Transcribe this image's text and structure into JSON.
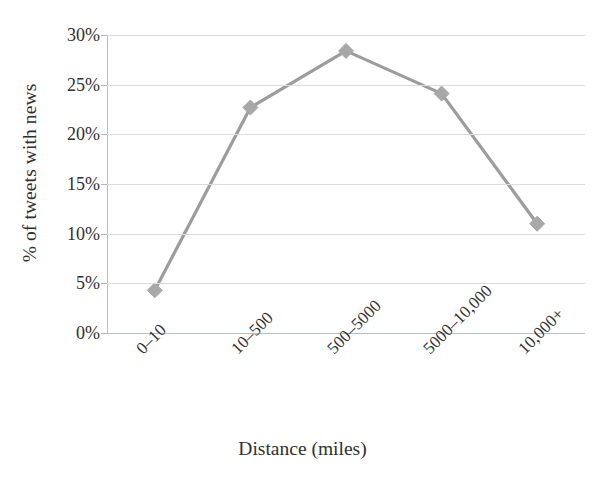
{
  "chart_data": {
    "type": "line",
    "title": "",
    "xlabel": "Distance (miles)",
    "ylabel": "% of tweets with news",
    "categories": [
      "0–10",
      "10–500",
      "500–5000",
      "5000–10,000",
      "10,000+"
    ],
    "values": [
      4.3,
      22.7,
      28.4,
      24.1,
      11.0
    ],
    "series": [
      {
        "name": "% of tweets with news",
        "values": [
          4.3,
          22.7,
          28.4,
          24.1,
          11.0
        ]
      }
    ],
    "ylim": [
      0,
      30
    ],
    "ytick_values": [
      0,
      5,
      10,
      15,
      20,
      25,
      30
    ],
    "ytick_labels": [
      "0%",
      "5%",
      "10%",
      "15%",
      "20%",
      "25%",
      "30%"
    ],
    "grid": true,
    "legend": "none",
    "marker": "diamond",
    "line_color": "#9c9c9c",
    "marker_color": "#a8a8a8",
    "grid_color": "#d9dde3",
    "axis_color": "#b9bec6",
    "text_color": "#2f2f2f",
    "background": "#ffffff"
  },
  "axes": {
    "y_title": "% of tweets with news",
    "x_title": "Distance (miles)"
  },
  "ticks": {
    "y": [
      {
        "label": "30%",
        "value": 30
      },
      {
        "label": "25%",
        "value": 25
      },
      {
        "label": "20%",
        "value": 20
      },
      {
        "label": "15%",
        "value": 15
      },
      {
        "label": "10%",
        "value": 10
      },
      {
        "label": "5%",
        "value": 5
      },
      {
        "label": "0%",
        "value": 0
      }
    ],
    "x": [
      {
        "label": "0–10"
      },
      {
        "label": "10–500"
      },
      {
        "label": "500–5000"
      },
      {
        "label": "5000–10,000"
      },
      {
        "label": "10,000+"
      }
    ]
  }
}
